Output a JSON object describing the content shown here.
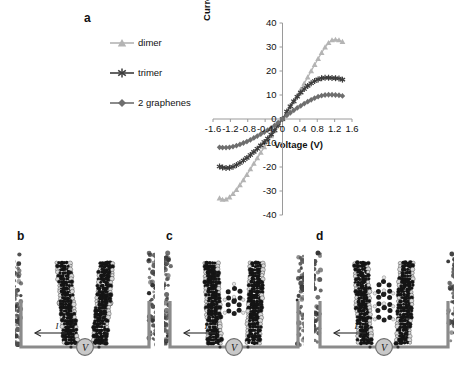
{
  "figure": {
    "panels": [
      {
        "letter": "a",
        "kind": "chart"
      },
      {
        "letter": "b",
        "kind": "schematic",
        "caption_hidden": "two graphene electrodes, no molecule"
      },
      {
        "letter": "c",
        "kind": "schematic",
        "caption_hidden": "dimer molecule between graphenes"
      },
      {
        "letter": "d",
        "kind": "schematic",
        "caption_hidden": "trimer molecule between graphenes"
      }
    ]
  },
  "schematic": {
    "current_label": "I",
    "voltage_source_label": "V"
  },
  "chart_data": {
    "type": "line",
    "title": "",
    "xlabel": "Voltage (V)",
    "ylabel": "Current (uA)",
    "xlim": [
      -1.6,
      1.6
    ],
    "ylim": [
      -40,
      40
    ],
    "xticks": [
      -1.6,
      -1.2,
      -0.8,
      -0.4,
      0,
      0.4,
      0.8,
      1.2,
      1.6
    ],
    "xtick_labels": [
      "-1.6",
      "-1.2",
      "-0.8",
      "-0.4",
      "0",
      "0.4",
      "0.8",
      "1.2",
      "1.6"
    ],
    "yticks": [
      -40,
      -30,
      -20,
      -10,
      0,
      10,
      20,
      30,
      40
    ],
    "ytick_labels": [
      "-40",
      "-30",
      "-20",
      "-10",
      "0",
      "10",
      "20",
      "30",
      "40"
    ],
    "grid": false,
    "legend_position": "upper-left-outside",
    "series": [
      {
        "name": "dimer",
        "color": "#b4b4b4",
        "marker": "triangle",
        "x": [
          -1.45,
          -1.38,
          -1.3,
          -1.22,
          -1.14,
          -1.06,
          -0.98,
          -0.9,
          -0.82,
          -0.74,
          -0.66,
          -0.58,
          -0.5,
          -0.42,
          -0.34,
          -0.26,
          -0.18,
          -0.1,
          0.0,
          0.1,
          0.18,
          0.26,
          0.34,
          0.42,
          0.5,
          0.58,
          0.66,
          0.74,
          0.82,
          0.9,
          0.98,
          1.06,
          1.14,
          1.22,
          1.3,
          1.38
        ],
        "y": [
          -33.0,
          -33.6,
          -33.5,
          -32.6,
          -31.2,
          -29.5,
          -27.5,
          -25.4,
          -23.2,
          -20.9,
          -18.6,
          -16.3,
          -14.0,
          -11.7,
          -9.4,
          -7.1,
          -4.8,
          -2.5,
          0.0,
          2.7,
          5.0,
          7.4,
          9.8,
          12.3,
          14.8,
          17.4,
          20.0,
          22.6,
          25.1,
          27.6,
          29.9,
          31.7,
          32.9,
          33.1,
          32.9,
          32.2
        ]
      },
      {
        "name": "trimer",
        "color": "#3d3d3d",
        "marker": "asterisk",
        "x": [
          -1.45,
          -1.38,
          -1.3,
          -1.22,
          -1.14,
          -1.06,
          -0.98,
          -0.9,
          -0.82,
          -0.74,
          -0.66,
          -0.58,
          -0.5,
          -0.42,
          -0.34,
          -0.26,
          -0.18,
          -0.1,
          0.0,
          0.1,
          0.18,
          0.26,
          0.34,
          0.42,
          0.5,
          0.58,
          0.66,
          0.74,
          0.82,
          0.9,
          0.98,
          1.06,
          1.14,
          1.22,
          1.3,
          1.38
        ],
        "y": [
          -19.8,
          -20.2,
          -20.4,
          -20.3,
          -19.9,
          -19.2,
          -18.3,
          -17.3,
          -16.2,
          -15.0,
          -13.7,
          -12.4,
          -11.0,
          -9.6,
          -8.1,
          -6.5,
          -4.7,
          -2.6,
          0.0,
          3.1,
          5.3,
          7.4,
          9.3,
          11.0,
          12.5,
          13.8,
          14.9,
          15.8,
          16.5,
          17.0,
          17.2,
          17.2,
          17.1,
          17.0,
          16.9,
          16.4
        ]
      },
      {
        "name": "2 graphenes",
        "color": "#6e6e6e",
        "marker": "diamond",
        "x": [
          -1.45,
          -1.38,
          -1.3,
          -1.22,
          -1.14,
          -1.06,
          -0.98,
          -0.9,
          -0.82,
          -0.74,
          -0.66,
          -0.58,
          -0.5,
          -0.42,
          -0.34,
          -0.26,
          -0.18,
          -0.1,
          0.0,
          0.1,
          0.18,
          0.26,
          0.34,
          0.42,
          0.5,
          0.58,
          0.66,
          0.74,
          0.82,
          0.9,
          0.98,
          1.06,
          1.14,
          1.22,
          1.3,
          1.38
        ],
        "y": [
          -11.8,
          -11.9,
          -11.9,
          -11.8,
          -11.5,
          -11.1,
          -10.6,
          -10.0,
          -9.4,
          -8.7,
          -7.9,
          -7.1,
          -6.3,
          -5.5,
          -4.6,
          -3.7,
          -2.7,
          -1.5,
          0.0,
          1.5,
          2.6,
          3.6,
          4.6,
          5.5,
          6.4,
          7.2,
          8.0,
          8.7,
          9.3,
          9.7,
          10.0,
          10.1,
          10.1,
          10.0,
          9.9,
          9.6
        ]
      }
    ]
  }
}
